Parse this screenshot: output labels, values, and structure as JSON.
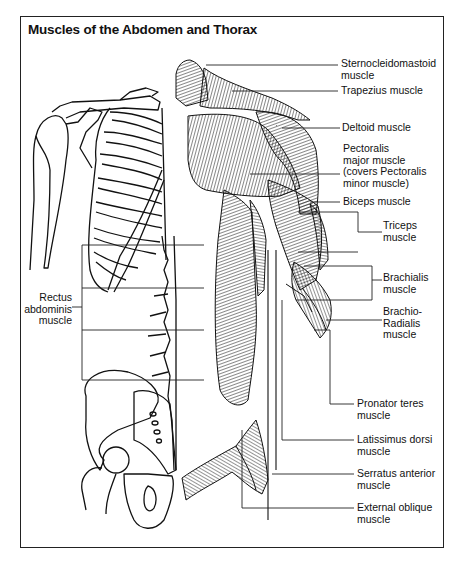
{
  "title": "Muscles of the Abdomen and Thorax",
  "labels": {
    "sternocleidomastoid": "Sternocleidomastoid\nmuscle",
    "trapezius": "Trapezius muscle",
    "deltoid": "Deltoid muscle",
    "pectoralis": "Pectoralis\nmajor muscle\n(covers Pectoralis\nminor muscle)",
    "biceps": "Biceps muscle",
    "triceps": "Triceps\nmuscle",
    "brachialis": "Brachialis\nmuscle",
    "brachioradialis": "Brachio-\nRadialis\nmuscle",
    "pronator_teres": "Pronator teres\nmuscle",
    "latissimus_dorsi": "Latissimus dorsi\nmuscle",
    "serratus_anterior": "Serratus anterior\nmuscle",
    "external_oblique": "External oblique\nmuscle",
    "rectus_abdominis": "Rectus\nabdominis\nmuscle"
  },
  "colors": {
    "ink": "#111111",
    "background": "#ffffff",
    "frame": "#222222"
  }
}
